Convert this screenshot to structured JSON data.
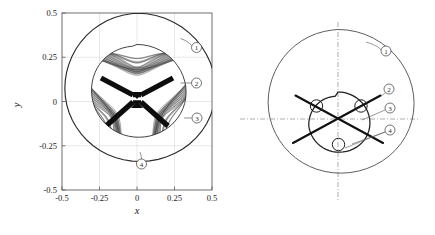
{
  "figure": {
    "type": "scientific-figure",
    "panels": [
      "left-plot",
      "right-schematic"
    ]
  },
  "left_panel": {
    "name": "hypotrochoid-plot",
    "xlabel": "x",
    "ylabel": "y",
    "xlim": [
      -0.5,
      0.5
    ],
    "ylim": [
      -0.5,
      0.5
    ],
    "xticks": [
      "-0.5",
      "-0.25",
      "0",
      "0.25",
      "0.5"
    ],
    "yticks": [
      "0.5",
      "0.25",
      "0",
      "-0.25",
      "-0.5"
    ],
    "xtick_values": [
      -0.5,
      -0.25,
      0,
      0.25,
      0.5
    ],
    "ytick_values": [
      0.5,
      0.25,
      0,
      -0.25,
      -0.5
    ],
    "grid": true,
    "box": true,
    "callouts": [
      {
        "id": "1",
        "label": "①",
        "target": "outer-envelope-curve"
      },
      {
        "id": "2",
        "label": "②",
        "target": "pattern-outer-boundary"
      },
      {
        "id": "3",
        "label": "③",
        "target": "pattern-lobe-edge"
      },
      {
        "id": "4",
        "label": "④",
        "target": "outer-envelope-bottom"
      }
    ]
  },
  "right_panel": {
    "name": "schematic-diagram",
    "callouts": [
      {
        "id": "1",
        "label": "①",
        "target": "outer-envelope-curve"
      },
      {
        "id": "2",
        "label": "②",
        "target": "crossing-line-upper"
      },
      {
        "id": "3",
        "label": "③",
        "target": "inner-triangle-curve"
      },
      {
        "id": "4",
        "label": "④",
        "target": "rolling-circle"
      }
    ],
    "elements": {
      "outer_curve": "rounded-triangle-envelope",
      "inner_curve": "rounded-triangle-inner",
      "rolling_circles": 3,
      "crossing_lines": 4,
      "center_axes": "dash-dot"
    }
  },
  "chart_data": {
    "type": "line",
    "title": "",
    "xlabel": "x",
    "ylabel": "y",
    "xlim": [
      -0.5,
      0.5
    ],
    "ylim": [
      -0.5,
      0.5
    ],
    "xticks": [
      -0.5,
      -0.25,
      0,
      0.25,
      0.5
    ],
    "yticks": [
      -0.5,
      -0.25,
      0,
      0.25,
      0.5
    ],
    "grid": true,
    "legend": null,
    "series": [
      {
        "name": "outer envelope (Reuleaux-like rounded triangle)",
        "description": "Outer bounding curve, apex at (0, 0.5), lower lobes near (-0.45,-0.3) and (0.45,-0.3)",
        "R": 0.5,
        "lobes": 3,
        "orientation_deg": 90
      },
      {
        "name": "hypotrochoid trace",
        "description": "Dense woven curve filling inner rounded-triangle region, radius approx 0.32",
        "R": 0.32,
        "lobes": 3,
        "orientation_deg": 90
      },
      {
        "name": "inner triangle (schematic)",
        "R": 0.16,
        "lobes": 3,
        "orientation_deg": 90
      }
    ],
    "annotations": [
      {
        "text": "①",
        "panel": "left"
      },
      {
        "text": "②",
        "panel": "left"
      },
      {
        "text": "③",
        "panel": "left"
      },
      {
        "text": "④",
        "panel": "left"
      },
      {
        "text": "①",
        "panel": "right"
      },
      {
        "text": "②",
        "panel": "right"
      },
      {
        "text": "③",
        "panel": "right"
      },
      {
        "text": "④",
        "panel": "right"
      }
    ]
  },
  "colors": {
    "background": "#ffffff",
    "axis": "#3c3c3c",
    "grid": "#d8d8d8",
    "curve": "#2a2a2a",
    "pattern_dark": "#111111",
    "pattern_mid": "#555555",
    "text": "#1a1a1a",
    "dashdot": "#7a7a7a"
  }
}
